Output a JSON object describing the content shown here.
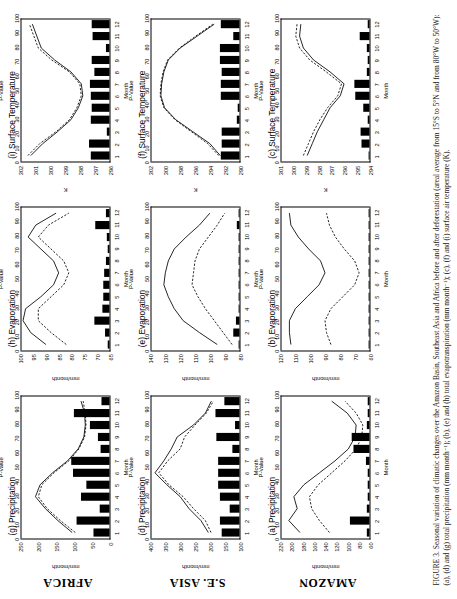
{
  "figure": {
    "caption_label": "FIGURE 3.",
    "caption_text": "Seasonal variation of climatic changes over the Amazon Basin, Southeast Asia and Africa before and after deforestation (areal average from 15°S to 5°N and from 80°W to 50°W): (a), (d) and (g) total precipitation (mm month⁻¹); (b), (e) and (h) total evapotranspiration (mm month⁻¹); (c), (f) and (i) surface air temperature (K)."
  },
  "row_labels": [
    "AFRICA",
    "S.E. ASIA",
    "AMAZON"
  ],
  "axes_common": {
    "xlabel": "Month",
    "xticks": [
      1,
      2,
      3,
      4,
      5,
      6,
      7,
      8,
      9,
      10,
      11,
      12
    ],
    "p_label": "P-Value",
    "p_ticks": [
      0,
      10,
      20,
      30,
      40,
      50,
      60,
      70,
      80,
      90,
      100
    ],
    "p_lim": [
      0,
      100
    ]
  },
  "chart_data": [
    {
      "id": "g",
      "type": "line",
      "region": "AFRICA",
      "title": "(g) Precipitation",
      "ylabel": "mm/month",
      "xlabel": "Month",
      "x": [
        1,
        2,
        3,
        4,
        5,
        6,
        7,
        8,
        9,
        10,
        11,
        12
      ],
      "ylim": [
        0,
        250
      ],
      "yticks": [
        0,
        50,
        100,
        150,
        200,
        250
      ],
      "series": [
        {
          "name": "before deforestation",
          "style": "solid",
          "values": [
            105,
            145,
            180,
            208,
            195,
            160,
            118,
            88,
            72,
            68,
            70,
            80
          ]
        },
        {
          "name": "after deforestation",
          "style": "dashed",
          "values": [
            96,
            138,
            175,
            200,
            190,
            156,
            114,
            86,
            70,
            66,
            68,
            74
          ]
        }
      ],
      "pvalues": [
        18,
        37,
        11,
        32,
        26,
        41,
        43,
        10,
        13,
        22,
        40,
        9
      ]
    },
    {
      "id": "h",
      "type": "line",
      "region": "AFRICA",
      "title": "(h) Evaporation",
      "ylabel": "mm/month",
      "xlabel": "Month",
      "x": [
        1,
        2,
        3,
        4,
        5,
        6,
        7,
        8,
        9,
        10,
        11,
        12
      ],
      "ylim": [
        65,
        100
      ],
      "yticks": [
        65,
        70,
        75,
        80,
        85,
        90,
        95,
        100
      ],
      "series": [
        {
          "name": "before deforestation",
          "style": "solid",
          "values": [
            90,
            96,
            99,
            98,
            92,
            87,
            85,
            87,
            92,
            97,
            94,
            86
          ]
        },
        {
          "name": "after deforestation",
          "style": "dashed",
          "values": [
            82,
            88,
            93,
            93,
            88,
            83,
            81,
            83,
            88,
            93,
            89,
            81
          ]
        }
      ],
      "pvalues": [
        2,
        5,
        17,
        8,
        7,
        7,
        6,
        4,
        2,
        3,
        16,
        4
      ]
    },
    {
      "id": "i",
      "type": "line",
      "region": "AFRICA",
      "title": "(i) Surface Temperature",
      "ylabel": "K",
      "xlabel": "Month",
      "x": [
        1,
        2,
        3,
        4,
        5,
        6,
        7,
        8,
        9,
        10,
        11,
        12
      ],
      "ylim": [
        296,
        302
      ],
      "yticks": [
        296,
        297,
        298,
        299,
        300,
        301,
        302
      ],
      "series": [
        {
          "name": "before deforestation",
          "style": "solid",
          "values": [
            301.3,
            300.5,
            299.5,
            298.6,
            298.1,
            297.8,
            297.9,
            298.6,
            299.7,
            300.6,
            300.9,
            301.2
          ]
        },
        {
          "name": "after deforestation",
          "style": "dashed",
          "values": [
            301.5,
            300.7,
            299.6,
            298.7,
            298.2,
            297.9,
            298.0,
            298.7,
            299.9,
            300.8,
            301.1,
            301.4
          ]
        }
      ],
      "pvalues": [
        21,
        23,
        3,
        21,
        20,
        21,
        22,
        17,
        20,
        4,
        19,
        20
      ]
    },
    {
      "id": "d",
      "type": "line",
      "region": "S.E. ASIA",
      "title": "(d) Precipitation",
      "ylabel": "mm/month",
      "xlabel": "Month",
      "x": [
        1,
        2,
        3,
        4,
        5,
        6,
        7,
        8,
        9,
        10,
        11,
        12
      ],
      "ylim": [
        100,
        400
      ],
      "yticks": [
        100,
        150,
        200,
        250,
        300,
        350,
        400
      ],
      "series": [
        {
          "name": "before deforestation",
          "style": "solid",
          "values": [
            205,
            230,
            270,
            300,
            345,
            385,
            355,
            330,
            310,
            255,
            215,
            195
          ]
        },
        {
          "name": "after deforestation",
          "style": "dashed",
          "values": [
            196,
            215,
            255,
            290,
            338,
            372,
            342,
            300,
            285,
            250,
            212,
            188
          ]
        }
      ],
      "pvalues": [
        20,
        22,
        11,
        22,
        24,
        24,
        24,
        8,
        26,
        5,
        27,
        17
      ]
    },
    {
      "id": "e",
      "type": "line",
      "region": "S.E. ASIA",
      "title": "(e) Evaporation",
      "ylabel": "mm/month",
      "xlabel": "Month",
      "x": [
        1,
        2,
        3,
        4,
        5,
        6,
        7,
        8,
        9,
        10,
        11,
        12
      ],
      "ylim": [
        80,
        140
      ],
      "yticks": [
        80,
        90,
        100,
        110,
        120,
        130,
        140
      ],
      "series": [
        {
          "name": "before deforestation",
          "style": "solid",
          "values": [
            95,
            107,
            118,
            124,
            128,
            131,
            130,
            128,
            124,
            116,
            107,
            100
          ]
        },
        {
          "name": "after deforestation",
          "style": "dashed",
          "values": [
            85,
            91,
            97,
            103,
            108,
            112,
            111,
            110,
            107,
            101,
            95,
            90
          ]
        }
      ],
      "pvalues": [
        1,
        7,
        4,
        1,
        1,
        1,
        1,
        1,
        1,
        1,
        3,
        1
      ]
    },
    {
      "id": "f",
      "type": "line",
      "region": "S.E. ASIA",
      "title": "(f) Surface Temperature",
      "ylabel": "K",
      "xlabel": "Month",
      "x": [
        1,
        2,
        3,
        4,
        5,
        6,
        7,
        8,
        9,
        10,
        11,
        12
      ],
      "ylim": [
        290,
        302
      ],
      "yticks": [
        290,
        292,
        294,
        296,
        298,
        300,
        302
      ],
      "series": [
        {
          "name": "before deforestation",
          "style": "solid",
          "values": [
            292.6,
            294.0,
            296.3,
            298.6,
            300.1,
            300.6,
            300.5,
            300.2,
            299.6,
            298.0,
            295.7,
            293.4
          ]
        },
        {
          "name": "after deforestation",
          "style": "dashed",
          "values": [
            292.8,
            294.3,
            296.5,
            298.7,
            300.2,
            300.7,
            300.6,
            300.3,
            299.7,
            298.1,
            295.9,
            293.6
          ]
        }
      ],
      "pvalues": [
        21,
        20,
        20,
        3,
        2,
        21,
        21,
        20,
        22,
        22,
        7,
        21
      ]
    },
    {
      "id": "a",
      "type": "line",
      "region": "AMAZON",
      "title": "(a) Precipitation",
      "ylabel": "mm/month",
      "xlabel": "Month",
      "x": [
        1,
        2,
        3,
        4,
        5,
        6,
        7,
        8,
        9,
        10,
        11,
        12
      ],
      "ylim": [
        60,
        220
      ],
      "yticks": [
        60,
        80,
        100,
        120,
        140,
        160,
        180,
        200,
        220
      ],
      "series": [
        {
          "name": "before deforestation",
          "style": "solid",
          "values": [
            185,
            205,
            190,
            196,
            178,
            150,
            122,
            98,
            86,
            84,
            100,
            128
          ]
        },
        {
          "name": "after deforestation",
          "style": "dashed",
          "values": [
            132,
            150,
            164,
            168,
            152,
            128,
            104,
            84,
            74,
            72,
            84,
            104
          ]
        }
      ],
      "pvalues": [
        3,
        22,
        3,
        2,
        2,
        2,
        4,
        18,
        20,
        3,
        2,
        2
      ]
    },
    {
      "id": "b",
      "type": "line",
      "region": "AMAZON",
      "title": "(b) Evaporation",
      "ylabel": "mm/month",
      "xlabel": "Month",
      "x": [
        1,
        2,
        3,
        4,
        5,
        6,
        7,
        8,
        9,
        10,
        11,
        12
      ],
      "ylim": [
        60,
        120
      ],
      "yticks": [
        60,
        70,
        80,
        90,
        100,
        110,
        120
      ],
      "series": [
        {
          "name": "before deforestation",
          "style": "solid",
          "values": [
            113,
            114,
            114,
            110,
            102,
            94,
            90,
            93,
            101,
            108,
            113,
            114
          ]
        },
        {
          "name": "after deforestation",
          "style": "dashed",
          "values": [
            86,
            89,
            90,
            86,
            78,
            70,
            67,
            70,
            77,
            83,
            87,
            89
          ]
        }
      ],
      "pvalues": [
        1,
        1,
        1,
        1,
        1,
        1,
        1,
        1,
        1,
        1,
        1,
        1
      ]
    },
    {
      "id": "c",
      "type": "line",
      "region": "AMAZON",
      "title": "(c) Surface Temperature",
      "ylabel": "K",
      "xlabel": "Month",
      "x": [
        1,
        2,
        3,
        4,
        5,
        6,
        7,
        8,
        9,
        10,
        11,
        12
      ],
      "ylim": [
        294,
        301
      ],
      "yticks": [
        294,
        295,
        296,
        297,
        298,
        299,
        300,
        301
      ],
      "series": [
        {
          "name": "before deforestation",
          "style": "solid",
          "values": [
            298.9,
            298.5,
            298.1,
            297.6,
            297.1,
            296.3,
            296.0,
            297.1,
            298.4,
            299.2,
            299.5,
            299.4
          ]
        },
        {
          "name": "after deforestation",
          "style": "dashed",
          "values": [
            299.2,
            298.8,
            298.4,
            297.9,
            297.3,
            296.5,
            296.2,
            297.4,
            298.7,
            299.5,
            299.8,
            299.7
          ]
        }
      ],
      "pvalues": [
        1,
        9,
        10,
        2,
        7,
        16,
        17,
        3,
        2,
        3,
        11,
        2
      ]
    }
  ]
}
